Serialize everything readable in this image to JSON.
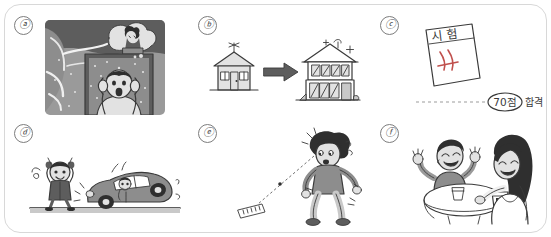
{
  "sheet": {
    "border_color": "#d8d8d8",
    "background": "#ffffff",
    "ink_color": "#3a3a3a"
  },
  "panels": [
    {
      "id": "a",
      "label": "ⓐ",
      "scene": "storm-disaster-shocked-man",
      "description": "A stormy night scene: clouds and wind at top, a person crouching on a rooftop, and a shocked man inside a window holding his head with both hands, mouth open.",
      "style": "grayscale-cartoon-illustration"
    },
    {
      "id": "b",
      "label": "ⓑ",
      "scene": "house-upgrade-arrow",
      "description": "A small simple one-story house on the left, a thick arrow pointing right, and a large two-story modern house with many windows and sparkle marks on the right.",
      "style": "line-drawing"
    },
    {
      "id": "c",
      "label": "ⓒ",
      "scene": "exam-paper-pass",
      "description": "A tilted exam sheet labeled in Korean with a red grading mark, a dashed line leading to a score bubble and a pass label.",
      "paper_text": "시 험",
      "score_text": "70점",
      "result_text": "합격",
      "style": "line-drawing"
    },
    {
      "id": "d",
      "label": "ⓓ",
      "scene": "child-waving-at-car",
      "description": "A small child on the left waving both arms happily, and a car on the right tilted up with a driver leaning out of the window, motion lines around it.",
      "style": "grayscale-cartoon-illustration"
    },
    {
      "id": "e",
      "label": "ⓔ",
      "scene": "man-spots-wallet-on-ground",
      "description": "A walking man with curly hair looks down, startled; a dotted sight line runs from his eyes to a wallet or banknote lying on the ground at the lower left.",
      "style": "grayscale-cartoon-illustration"
    },
    {
      "id": "f",
      "label": "ⓕ",
      "scene": "two-people-talking-at-table",
      "description": "A smiling man with raised hands and a long-haired woman sit at a round table with two cups, chatting cheerfully.",
      "style": "grayscale-cartoon-illustration"
    }
  ]
}
